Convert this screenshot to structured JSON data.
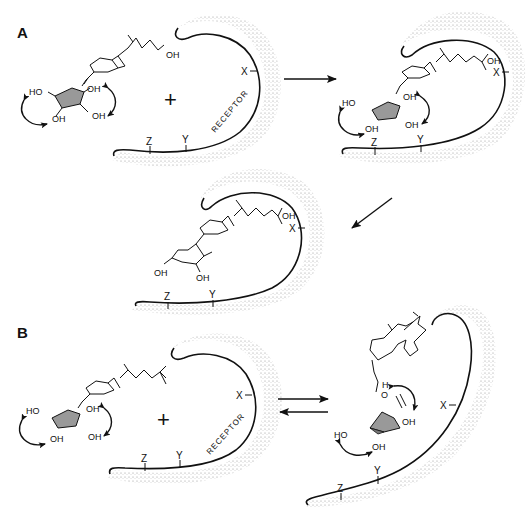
{
  "figure": {
    "type": "receptor-ligand binding schematic",
    "panels": [
      {
        "label": "A",
        "description": "Sequential binding: free ligand with flipping A-ring conformers approaches receptor, enters pocket, and adopts bound conformation",
        "stages": [
          {
            "id": "A1",
            "receptor_label": "RECEPTOR",
            "sites": [
              "X",
              "Y",
              "Z"
            ],
            "center_mark": "+",
            "ligand_labels": [
              "OH",
              "HO",
              "OH",
              "OH",
              "OH"
            ],
            "ligand_position": "outside"
          },
          {
            "id": "A2",
            "sites": [
              "X",
              "Y",
              "Z"
            ],
            "ligand_labels": [
              "OH",
              "HO",
              "OH",
              "OH",
              "OH"
            ],
            "ligand_position": "inside"
          },
          {
            "id": "A3",
            "sites": [
              "X",
              "Y",
              "Z"
            ],
            "ligand_labels": [
              "OH",
              "OH",
              "OH"
            ],
            "ligand_position": "bound"
          }
        ],
        "arrows": [
          "right",
          "down-left"
        ]
      },
      {
        "label": "B",
        "description": "Equilibrium between unbound ligand (no side-chain OH) and receptor-associated conformer",
        "stages": [
          {
            "id": "B1",
            "receptor_label": "RECEPTOR",
            "sites": [
              "X",
              "Y",
              "Z"
            ],
            "center_mark": "+",
            "ligand_labels": [
              "HO",
              "OH",
              "OH",
              "OH"
            ],
            "ligand_position": "outside"
          },
          {
            "id": "B2",
            "sites": [
              "X",
              "Y",
              "Z"
            ],
            "ligand_labels": [
              "H",
              "O",
              "OH",
              "HO",
              "OH"
            ],
            "ligand_position": "inside"
          }
        ],
        "arrows": [
          "equilibrium"
        ]
      }
    ]
  },
  "labels": {
    "panel_a": "A",
    "panel_b": "B",
    "receptor": "RECEPTOR",
    "site_x": "X",
    "site_y": "Y",
    "site_z": "Z",
    "oh": "OH",
    "ho": "HO",
    "h": "H",
    "o": "O",
    "plus": "+"
  }
}
